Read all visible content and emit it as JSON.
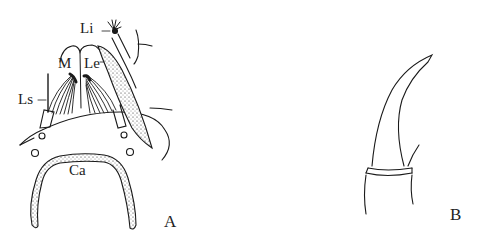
{
  "figure": {
    "panels": [
      {
        "id": "A",
        "letter": "A",
        "description": "Mouthparts (ventral view)",
        "labels": {
          "li": "Li",
          "m": "M",
          "le": "Le",
          "ls": "Ls",
          "ca": "Ca"
        }
      },
      {
        "id": "B",
        "letter": "B",
        "description": "Tarsal claw"
      }
    ],
    "colors": {
      "ink": "#1a1a1a",
      "background": "#ffffff"
    }
  }
}
